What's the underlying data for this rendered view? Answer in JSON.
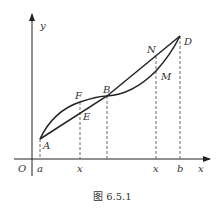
{
  "figure": {
    "caption": "图 6.5.1",
    "axes": {
      "x_label": "x",
      "y_label": "y",
      "origin_label": "O"
    },
    "x_ticks": [
      "a",
      "x",
      "x",
      "b"
    ],
    "points": {
      "A": "A",
      "B": "B",
      "D": "D",
      "E": "E",
      "F": "F",
      "M": "M",
      "N": "N"
    },
    "colors": {
      "stroke": "#222222",
      "text": "#333333",
      "dashed": "#444444"
    }
  }
}
